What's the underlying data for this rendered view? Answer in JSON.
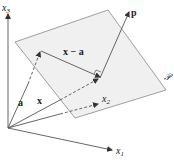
{
  "figure": {
    "type": "3d vector diagram",
    "axes": {
      "x1": {
        "label": "x",
        "subscript": "1"
      },
      "x2": {
        "label": "x",
        "subscript": "2"
      },
      "x3": {
        "label": "x",
        "subscript": "3"
      }
    },
    "plane": {
      "label": "𝒫",
      "fill": "#f0f0f0",
      "stroke": "#888888"
    },
    "vectors": {
      "a": {
        "label": "a"
      },
      "x": {
        "label": "x"
      },
      "x_minus_a": {
        "label": "x − a"
      },
      "p": {
        "label": "p"
      }
    },
    "colors": {
      "line": "#555555",
      "arrow": "#333333"
    },
    "caption": "Figure"
  }
}
